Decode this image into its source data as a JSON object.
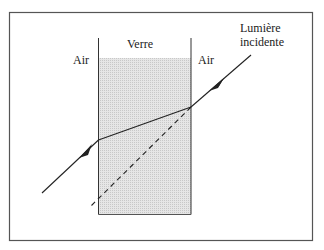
{
  "diagram": {
    "labels": {
      "glass": "Verre",
      "air_left": "Air",
      "air_right": "Air",
      "incident_line1": "Lumière",
      "incident_line2": "incidente"
    },
    "colors": {
      "frame": "#555555",
      "glass_fill": "#dcdcdc",
      "ray": "#222222",
      "dashed": "#222222"
    },
    "elements": [
      {
        "id": "glass-slab",
        "type": "rectangle",
        "description": "Shaded glass slab with vertical boundaries"
      },
      {
        "id": "incident-ray",
        "type": "arrow",
        "description": "Incoming light ray from upper right"
      },
      {
        "id": "refracted-ray",
        "type": "line",
        "description": "Ray bent inside glass toward normal"
      },
      {
        "id": "emergent-ray",
        "type": "arrow",
        "description": "Outgoing ray parallel to incident ray, laterally shifted"
      },
      {
        "id": "undeviated-path",
        "type": "dashed-line",
        "description": "Extension of incident ray without refraction"
      }
    ]
  }
}
